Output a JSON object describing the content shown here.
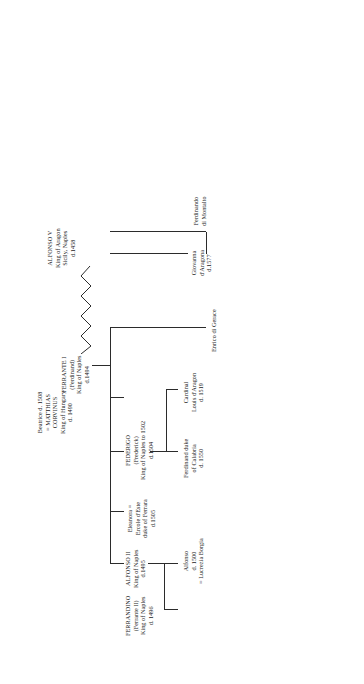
{
  "document": {
    "kind": "genealogical-table",
    "orientation": "rotated-90-counterclockwise",
    "title": "The Aragonese Kings of Naples"
  },
  "people": {
    "alfonso_v": {
      "lines": [
        "ALFONSO V",
        "King of Aragon",
        "Sicily, Naples",
        "d.1458"
      ]
    },
    "ferrante_i": {
      "lines": [
        "FERRANTE I",
        "(Ferdinand)",
        "King of Naples",
        "d.1494"
      ]
    },
    "alfonso_ii": {
      "lines": [
        "ALFONSO II",
        "King of Naples",
        "d.1495"
      ]
    },
    "beatrice": {
      "lines": [
        "Beatrice d. 1508",
        "= MATTHIAS",
        "CORVINUS",
        "King of Hungary",
        "d. 1490"
      ]
    },
    "ferrandino": {
      "lines": [
        "FERRANDINO",
        "(Ferrante II)",
        "King of Naples",
        "d. 1496"
      ]
    },
    "alfonso_1500": {
      "lines": [
        "Alfonso",
        "d. 1500",
        "= Lucrezia Borgia"
      ]
    },
    "eleanora": {
      "lines": [
        "Eleanora =",
        "Ercole d'Este",
        "duke of Ferrara",
        "d.1505"
      ]
    },
    "federigo": {
      "lines": [
        "FEDERIGO",
        "(Frederick)",
        "King of Naples to 1502",
        "d.1504"
      ]
    },
    "ferdinand_calabria": {
      "lines": [
        "Ferdinand duke",
        "of Calabria",
        "d. 1550"
      ]
    },
    "cardinal_louis": {
      "lines": [
        "Cardinal",
        "Louis d'Aragon",
        "d. 1519"
      ]
    },
    "enrico": {
      "lines": [
        "Enrico di Gerace"
      ]
    },
    "giovanna": {
      "lines": [
        "Giovanna",
        "d'Aragona",
        "d.1577"
      ]
    },
    "ferdinando_montalto": {
      "lines": [
        "Ferdinando",
        "di Montalto"
      ]
    }
  },
  "colors": {
    "ink": "#1a1a1a",
    "rule": "#2b2b2b",
    "paper": "#ffffff"
  }
}
